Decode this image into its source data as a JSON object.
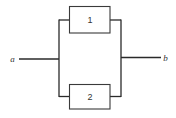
{
  "diagram": {
    "type": "parallel-system-block-diagram",
    "terminals": {
      "input": {
        "label": "a"
      },
      "output": {
        "label": "b"
      }
    },
    "components": [
      {
        "id": "1",
        "label": "1",
        "branch": "upper"
      },
      {
        "id": "2",
        "label": "2",
        "branch": "lower"
      }
    ],
    "connections": [
      {
        "from": "a",
        "to": "1"
      },
      {
        "from": "a",
        "to": "2"
      },
      {
        "from": "1",
        "to": "b"
      },
      {
        "from": "2",
        "to": "b"
      }
    ],
    "colors": {
      "line": "#2a2a2a",
      "background": "#ffffff"
    }
  }
}
